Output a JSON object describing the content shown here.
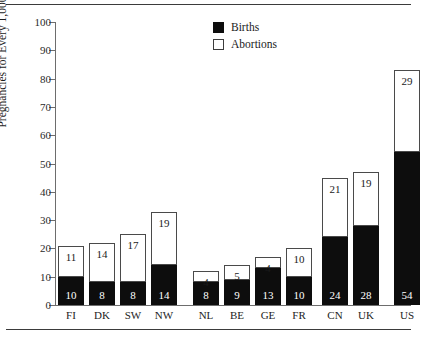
{
  "chart_data": {
    "type": "bar",
    "stacked": true,
    "title": "",
    "xlabel": "",
    "ylabel": "Pregnancies for Every 1,000 Women",
    "ylim": [
      0,
      100
    ],
    "yticks": [
      0,
      10,
      20,
      30,
      40,
      50,
      60,
      70,
      80,
      90,
      100
    ],
    "grid": false,
    "legend_position": "top-center",
    "categories": [
      "FI",
      "DK",
      "SW",
      "NW",
      "NL",
      "BE",
      "GE",
      "FR",
      "CN",
      "UK",
      "US"
    ],
    "groups": [
      {
        "name": "group-1",
        "categories": [
          "FI",
          "DK",
          "SW",
          "NW"
        ]
      },
      {
        "name": "group-2",
        "categories": [
          "NL",
          "BE",
          "GE",
          "FR"
        ]
      },
      {
        "name": "group-3",
        "categories": [
          "CN",
          "UK",
          "US"
        ]
      }
    ],
    "series": [
      {
        "name": "Births",
        "color": "#0d0d0d",
        "values": [
          10,
          8,
          8,
          14,
          8,
          9,
          13,
          10,
          24,
          28,
          54
        ]
      },
      {
        "name": "Abortions",
        "color": "#ffffff",
        "values": [
          11,
          14,
          17,
          19,
          4,
          5,
          4,
          10,
          21,
          19,
          29
        ]
      }
    ],
    "totals": [
      21,
      22,
      25,
      33,
      12,
      14,
      17,
      20,
      45,
      47,
      83
    ]
  },
  "legend": {
    "items": [
      {
        "label": "Births",
        "swatch": "filled-square-icon"
      },
      {
        "label": "Abortions",
        "swatch": "hollow-square-icon"
      }
    ]
  },
  "axes": {
    "y_label": "Pregnancies for Every 1,000 Women",
    "y_ticks": [
      "0",
      "10",
      "20",
      "30",
      "40",
      "50",
      "60",
      "70",
      "80",
      "90",
      "100"
    ],
    "x_ticks": [
      "FI",
      "DK",
      "SW",
      "NW",
      "NL",
      "BE",
      "GE",
      "FR",
      "CN",
      "UK",
      "US"
    ]
  },
  "bars": [
    {
      "category": "FI",
      "births": "10",
      "abortions": "11",
      "x": 58
    },
    {
      "category": "DK",
      "births": "8",
      "abortions": "14",
      "x": 89
    },
    {
      "category": "SW",
      "births": "8",
      "abortions": "17",
      "x": 120
    },
    {
      "category": "NW",
      "births": "14",
      "abortions": "19",
      "x": 151
    },
    {
      "category": "NL",
      "births": "8",
      "abortions": "4",
      "x": 193
    },
    {
      "category": "BE",
      "births": "9",
      "abortions": "5",
      "x": 224
    },
    {
      "category": "GE",
      "births": "13",
      "abortions": "4",
      "x": 255
    },
    {
      "category": "FR",
      "births": "10",
      "abortions": "10",
      "x": 286
    },
    {
      "category": "CN",
      "births": "24",
      "abortions": "21",
      "x": 322
    },
    {
      "category": "UK",
      "births": "28",
      "abortions": "19",
      "x": 353
    },
    {
      "category": "US",
      "births": "54",
      "abortions": "29",
      "x": 394
    }
  ]
}
